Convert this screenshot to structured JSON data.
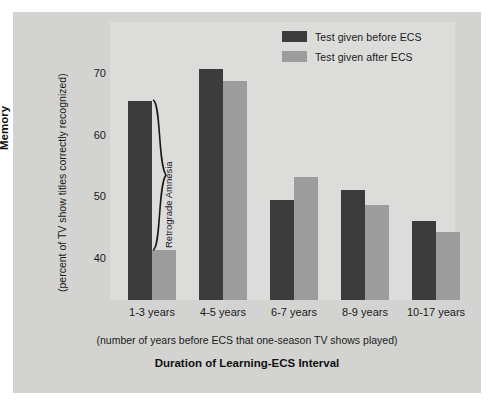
{
  "chart_data": {
    "type": "bar",
    "title": "",
    "categories": [
      "1-3 years",
      "4-5 years",
      "6-7 years",
      "8-9 years",
      "10-17 years"
    ],
    "series": [
      {
        "name": "Test given before ECS",
        "color": "#3c3c3c",
        "values": [
          65.5,
          70.6,
          49.5,
          51.1,
          46.1
        ]
      },
      {
        "name": "Test given after ECS",
        "color": "#9c9c9c",
        "values": [
          41.3,
          68.7,
          53.1,
          48.7,
          44.2
        ]
      }
    ],
    "xlabel": "Duration of Learning-ECS Interval",
    "xlabel_sub": "(number of years before ECS that one-season TV shows played)",
    "ylabel": "Memory",
    "ylabel_sub": "(percent of TV show titles correctly recognized)",
    "yticks": [
      70,
      60,
      50,
      40
    ],
    "ylim": [
      36,
      74
    ],
    "grid": false,
    "legend_position": "top-right",
    "annotations": [
      {
        "text": "Retrograde Amnesia",
        "type": "brace",
        "group": "1-3 years"
      }
    ]
  },
  "legend": {
    "items": [
      {
        "label": "Test given before ECS",
        "swatch": "#3c3c3c"
      },
      {
        "label": "Test given after ECS",
        "swatch": "#9c9c9c"
      }
    ]
  },
  "axes": {
    "y": {
      "title": "Memory",
      "subtitle": "(percent of TV show titles correctly recognized)",
      "ticks": [
        "70",
        "60",
        "50",
        "40"
      ]
    },
    "x": {
      "title": "Duration of Learning-ECS Interval",
      "subtitle": "(number of years before ECS that one-season TV shows played)",
      "categories": [
        "1-3 years",
        "4-5 years",
        "6-7 years",
        "8-9 years",
        "10-17 years"
      ]
    }
  },
  "annotation": {
    "retrograde_amnesia": "Retrograde Amnesia"
  },
  "colors": {
    "background": "#d3d3d1",
    "panel": "#dcdcda",
    "bar_dark": "#3c3c3c",
    "bar_light": "#9c9c9c",
    "text": "#1a1a1a"
  }
}
